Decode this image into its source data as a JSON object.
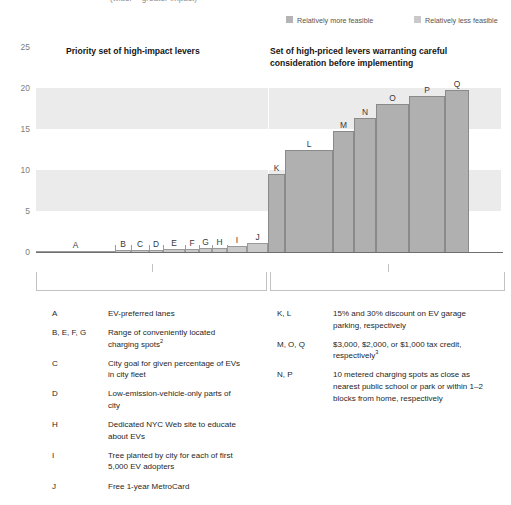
{
  "subtitle": "(wider = greater impact)",
  "colors": {
    "more_feasible": "#c9c9c9",
    "less_feasible": "#b0b0b0",
    "band": "#ebebeb",
    "axis": "#6e6e6e"
  },
  "legend": {
    "items": [
      {
        "label": "Relatively more feasible",
        "swatch": "#b4b4b4",
        "left": 0
      },
      {
        "label": "Relatively less feasible",
        "swatch": "#c9c9c9",
        "left": 128
      }
    ]
  },
  "headers": {
    "left": "Priority set of high-impact levers",
    "right_line1": "Set of high-priced levers warranting careful",
    "right_line2": "consideration before implementing"
  },
  "chart_data": {
    "type": "bar",
    "title": "",
    "xlabel": "",
    "ylabel": "",
    "ylim": [
      0,
      25
    ],
    "yticks": [
      0,
      5,
      10,
      15,
      20,
      25
    ],
    "grid": false,
    "bands": [
      [
        15,
        20
      ],
      [
        5,
        10
      ]
    ],
    "legend_position": "top-right",
    "note": "Bar width encodes impact; height encodes cost.",
    "categories": [
      "A",
      "B",
      "C",
      "D",
      "E",
      "F",
      "G",
      "H",
      "I",
      "J",
      "K",
      "L",
      "M",
      "N",
      "O",
      "P",
      "Q"
    ],
    "values": [
      0.15,
      0.2,
      0.25,
      0.3,
      0.35,
      0.4,
      0.45,
      0.5,
      0.7,
      1.1,
      9.5,
      12.5,
      14.7,
      16.4,
      18.0,
      19.0,
      19.8
    ],
    "widths": [
      79,
      16,
      18,
      14,
      22,
      14,
      13,
      15,
      20,
      21,
      17,
      48,
      21,
      22,
      33,
      36,
      24
    ],
    "series": [
      {
        "name": "Relatively more feasible",
        "categories": [
          "A",
          "B",
          "C",
          "D",
          "E",
          "F",
          "G",
          "H",
          "I",
          "J"
        ]
      },
      {
        "name": "Relatively less feasible",
        "categories": [
          "K",
          "L",
          "M",
          "N",
          "O",
          "P",
          "Q"
        ]
      }
    ]
  },
  "key_left": [
    {
      "id": "A",
      "text": "EV-preferred lanes"
    },
    {
      "id": "B, E, F, G",
      "text": "Range of conveniently located charging spots",
      "sup": "2"
    },
    {
      "id": "C",
      "text": "City goal for given percentage of EVs in city fleet"
    },
    {
      "id": "D",
      "text": "Low-emission-vehicle-only parts of city"
    },
    {
      "id": "H",
      "text": "Dedicated NYC Web site to educate about EVs"
    },
    {
      "id": "I",
      "text": "Tree planted by city for each of first 5,000 EV adopters"
    },
    {
      "id": "J",
      "text": "Free 1-year MetroCard"
    }
  ],
  "key_right": [
    {
      "id": "K, L",
      "text": "15% and 30% discount on EV garage parking, respectively"
    },
    {
      "id": "M, O, Q",
      "text": "$3,000, $2,000, or $1,000 tax credit, respectively",
      "sup": "3"
    },
    {
      "id": "N, P",
      "text": "10 metered charging spots as close as nearest public school or park or within 1–2 blocks from home, respectively"
    }
  ]
}
